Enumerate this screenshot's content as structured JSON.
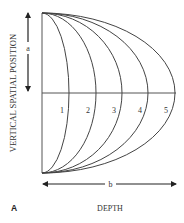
{
  "figure": {
    "panel_label": "A",
    "x_axis_label": "DEPTH",
    "y_axis_label": "VERTICAL SPATIAL POSITION",
    "dimension_a_label": "a",
    "dimension_b_label": "b",
    "curve_labels": [
      "1",
      "2",
      "3",
      "4",
      "5"
    ],
    "line_color": "#444444",
    "frame": {
      "left_x": 42,
      "top_y": 13,
      "bottom_y": 173,
      "mid_y": 93
    },
    "curve_peaks_x": [
      69,
      96,
      122,
      148,
      175
    ],
    "curve_label_positions": [
      {
        "x": 62,
        "y": 113
      },
      {
        "x": 88,
        "y": 113
      },
      {
        "x": 114,
        "y": 113
      },
      {
        "x": 140,
        "y": 113
      },
      {
        "x": 166,
        "y": 113
      }
    ]
  }
}
